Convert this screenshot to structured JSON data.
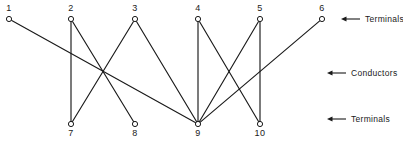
{
  "figure": {
    "width": 403,
    "height": 151,
    "background_color": "#ffffff",
    "line_color": "#1a1a1a",
    "node_fill_color": "#ffffff"
  },
  "chart_data": {
    "type": "diagram",
    "title": "",
    "subtitle": "",
    "xlabel": "",
    "ylabel": "",
    "nodes": [
      {
        "id": 1,
        "label": "1",
        "row": "top",
        "x": 9,
        "y": 19
      },
      {
        "id": 2,
        "label": "2",
        "row": "top",
        "x": 71,
        "y": 19
      },
      {
        "id": 3,
        "label": "3",
        "row": "top",
        "x": 135,
        "y": 19
      },
      {
        "id": 4,
        "label": "4",
        "row": "top",
        "x": 198,
        "y": 19
      },
      {
        "id": 5,
        "label": "5",
        "row": "top",
        "x": 260,
        "y": 19
      },
      {
        "id": 6,
        "label": "6",
        "row": "top",
        "x": 322,
        "y": 19
      },
      {
        "id": 7,
        "label": "7",
        "row": "bottom",
        "x": 71,
        "y": 124
      },
      {
        "id": 8,
        "label": "8",
        "row": "bottom",
        "x": 135,
        "y": 124
      },
      {
        "id": 9,
        "label": "9",
        "row": "bottom",
        "x": 198,
        "y": 124
      },
      {
        "id": 10,
        "label": "10",
        "row": "bottom",
        "x": 260,
        "y": 124
      }
    ],
    "node_radius": 2.6,
    "edges": [
      {
        "from": 1,
        "to": 9
      },
      {
        "from": 2,
        "to": 7
      },
      {
        "from": 2,
        "to": 8
      },
      {
        "from": 3,
        "to": 7
      },
      {
        "from": 3,
        "to": 9
      },
      {
        "from": 4,
        "to": 9
      },
      {
        "from": 4,
        "to": 10
      },
      {
        "from": 5,
        "to": 9
      },
      {
        "from": 5,
        "to": 10
      },
      {
        "from": 6,
        "to": 9
      }
    ],
    "callouts": [
      {
        "label": "Terminals",
        "arrow_tip_x": 341,
        "arrow_tail_x": 360,
        "y": 19,
        "text_x": 365
      },
      {
        "label": "Conductors",
        "arrow_tip_x": 327,
        "arrow_tail_x": 346,
        "y": 73,
        "text_x": 351
      },
      {
        "label": "Terminals",
        "arrow_tip_x": 327,
        "arrow_tail_x": 346,
        "y": 119,
        "text_x": 351
      }
    ]
  }
}
